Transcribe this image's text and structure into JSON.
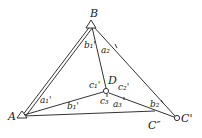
{
  "diagram": {
    "points": {
      "A": {
        "label": "A",
        "x": 22,
        "y": 116
      },
      "B": {
        "label": "B",
        "x": 91,
        "y": 25
      },
      "D": {
        "label": "D",
        "x": 106,
        "y": 91
      },
      "C1": {
        "label": "C'",
        "x": 177,
        "y": 118
      },
      "C2": {
        "label": "C″",
        "x": 155,
        "y": 111
      }
    },
    "angle_labels": {
      "b1p_top": "b₁'",
      "a2": "a₂",
      "c1p": "c₁'",
      "c2p": "c₂'",
      "a1p": "a₁'",
      "b1p_bottom": "b₁'",
      "c3": "c₃",
      "a3": "a₃",
      "b2": "b₂"
    }
  }
}
